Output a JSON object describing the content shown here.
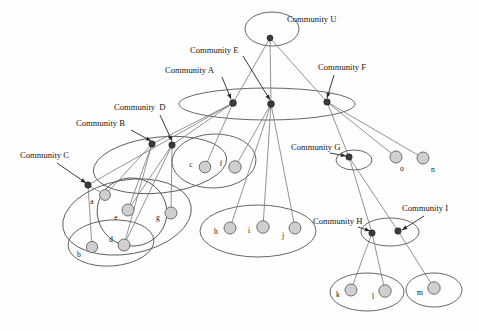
{
  "figure": {
    "colors": {
      "community_node": "#3b3b3b",
      "leaf_node": "#cfcfcf",
      "leaf_outline": "#6f6f6f",
      "ellipse_outline": "#555555",
      "edge": "#777777",
      "label_text": "#141414",
      "background": "#ffffff"
    }
  },
  "community_labels": [
    {
      "id": "U",
      "text": "Community U",
      "x": 287,
      "y": 22,
      "anchor": "start"
    },
    {
      "id": "E",
      "text": "Community E",
      "x": 190,
      "y": 53,
      "anchor": "start"
    },
    {
      "id": "A",
      "text": "Community A",
      "x": 165,
      "y": 73,
      "anchor": "start"
    },
    {
      "id": "F",
      "text": "Community F",
      "x": 318,
      "y": 70,
      "anchor": "start"
    },
    {
      "id": "D",
      "text": "Community  D",
      "x": 114,
      "y": 110,
      "anchor": "start"
    },
    {
      "id": "B",
      "text": "Community B",
      "x": 76,
      "y": 126,
      "anchor": "start"
    },
    {
      "id": "C",
      "text": "Community C",
      "x": 20,
      "y": 158,
      "anchor": "start"
    },
    {
      "id": "G",
      "text": "Community G",
      "x": 291,
      "y": 150,
      "anchor": "start"
    },
    {
      "id": "H",
      "text": "Community H",
      "x": 313,
      "y": 224,
      "anchor": "start"
    },
    {
      "id": "I",
      "text": "Community I",
      "x": 402,
      "y": 211,
      "anchor": "start"
    }
  ],
  "leader_lines": [
    {
      "name": "leader-E",
      "from": [
        243,
        56
      ],
      "to": [
        270,
        100
      ]
    },
    {
      "name": "leader-A",
      "from": [
        222,
        77
      ],
      "to": [
        231,
        99
      ]
    },
    {
      "name": "leader-F",
      "from": [
        334,
        75
      ],
      "to": [
        327,
        98
      ]
    },
    {
      "name": "leader-D",
      "from": [
        160,
        115
      ],
      "to": [
        172,
        141
      ]
    },
    {
      "name": "leader-B",
      "from": [
        131,
        130
      ],
      "to": [
        151,
        141
      ]
    },
    {
      "name": "leader-C",
      "from": [
        57,
        163
      ],
      "to": [
        86,
        183
      ]
    },
    {
      "name": "leader-G",
      "from": [
        330,
        153
      ],
      "to": [
        346,
        156
      ]
    },
    {
      "name": "leader-H",
      "from": [
        358,
        227
      ],
      "to": [
        370,
        231
      ]
    },
    {
      "name": "leader-I",
      "from": [
        424,
        216
      ],
      "to": [
        402,
        230
      ]
    }
  ],
  "community_nodes": [
    {
      "id": "U",
      "x": 270,
      "y": 38,
      "r": 3.0
    },
    {
      "id": "A",
      "x": 233,
      "y": 103,
      "r": 3.4
    },
    {
      "id": "E",
      "x": 271,
      "y": 104,
      "r": 3.4
    },
    {
      "id": "F",
      "x": 327,
      "y": 102,
      "r": 3.2
    },
    {
      "id": "B",
      "x": 152,
      "y": 144,
      "r": 3.2
    },
    {
      "id": "D",
      "x": 172,
      "y": 145,
      "r": 3.2
    },
    {
      "id": "C",
      "x": 88,
      "y": 185,
      "r": 3.2
    },
    {
      "id": "G",
      "x": 349,
      "y": 157,
      "r": 3.2
    },
    {
      "id": "H",
      "x": 372,
      "y": 233,
      "r": 3.2
    },
    {
      "id": "I",
      "x": 398,
      "y": 231,
      "r": 3.2
    }
  ],
  "leaf_nodes": [
    {
      "id": "a",
      "x": 105,
      "y": 195,
      "r": 5.4,
      "lx": 92,
      "ly": 204
    },
    {
      "id": "e",
      "x": 128,
      "y": 210,
      "r": 6.0,
      "lx": 116,
      "ly": 220
    },
    {
      "id": "g",
      "x": 171,
      "y": 213,
      "r": 6.0,
      "lx": 158,
      "ly": 220
    },
    {
      "id": "b",
      "x": 92,
      "y": 247,
      "r": 5.6,
      "lx": 79,
      "ly": 257
    },
    {
      "id": "d",
      "x": 124,
      "y": 245,
      "r": 6.0,
      "lx": 111,
      "ly": 242
    },
    {
      "id": "c",
      "x": 205,
      "y": 167,
      "r": 5.8,
      "lx": 191,
      "ly": 167
    },
    {
      "id": "f",
      "x": 235,
      "y": 167,
      "r": 6.2,
      "lx": 221,
      "ly": 166
    },
    {
      "id": "h",
      "x": 230,
      "y": 228,
      "r": 6.0,
      "lx": 216,
      "ly": 234
    },
    {
      "id": "i",
      "x": 263,
      "y": 227,
      "r": 6.2,
      "lx": 249,
      "ly": 233
    },
    {
      "id": "j",
      "x": 295,
      "y": 228,
      "r": 6.0,
      "lx": 283,
      "ly": 238
    },
    {
      "id": "o",
      "x": 396,
      "y": 157,
      "r": 6.0,
      "lx": 402,
      "ly": 171
    },
    {
      "id": "n",
      "x": 423,
      "y": 158,
      "r": 6.0,
      "lx": 433,
      "ly": 172
    },
    {
      "id": "k",
      "x": 351,
      "y": 290,
      "r": 6.0,
      "lx": 338,
      "ly": 297
    },
    {
      "id": "l",
      "x": 385,
      "y": 291,
      "r": 6.2,
      "lx": 373,
      "ly": 299
    },
    {
      "id": "m",
      "x": 434,
      "y": 288,
      "r": 6.2,
      "lx": 420,
      "ly": 295
    }
  ],
  "ellipses": [
    {
      "name": "ellipse-community-u",
      "cx": 272,
      "cy": 29,
      "rx": 27,
      "ry": 17,
      "rot": 0
    },
    {
      "name": "ellipse-top-level",
      "cx": 267,
      "cy": 104,
      "rx": 88,
      "ry": 16,
      "rot": 0
    },
    {
      "name": "ellipse-left-upper",
      "cx": 160,
      "cy": 165,
      "rx": 67,
      "ry": 28,
      "rot": -6
    },
    {
      "name": "ellipse-left-lower",
      "cx": 127,
      "cy": 217,
      "rx": 65,
      "ry": 37,
      "rot": -10
    },
    {
      "name": "ellipse-bd-inner",
      "cx": 111,
      "cy": 243,
      "rx": 43,
      "ry": 23,
      "rot": -4
    },
    {
      "name": "ellipse-ae-inner",
      "cx": 132,
      "cy": 212,
      "rx": 35,
      "ry": 34,
      "rot": 18
    },
    {
      "name": "ellipse-c-f",
      "cx": 214,
      "cy": 161,
      "rx": 42,
      "ry": 27,
      "rot": -2
    },
    {
      "name": "ellipse-h-i-j",
      "cx": 258,
      "cy": 231,
      "rx": 58,
      "ry": 26,
      "rot": 0
    },
    {
      "name": "ellipse-community-g",
      "cx": 354,
      "cy": 160,
      "rx": 18,
      "ry": 10,
      "rot": 0
    },
    {
      "name": "ellipse-community-h-i",
      "cx": 390,
      "cy": 232,
      "rx": 29,
      "ry": 14,
      "rot": 0
    },
    {
      "name": "ellipse-k-l",
      "cx": 367,
      "cy": 292,
      "rx": 37,
      "ry": 19,
      "rot": 0
    },
    {
      "name": "ellipse-m",
      "cx": 434,
      "cy": 290,
      "rx": 28,
      "ry": 17,
      "rot": 0
    }
  ],
  "edges": [
    {
      "from": "U",
      "to": "A"
    },
    {
      "from": "U",
      "to": "E"
    },
    {
      "from": "U",
      "to": "F"
    },
    {
      "from": "A",
      "to": "B"
    },
    {
      "from": "A",
      "to": "D"
    },
    {
      "from": "A",
      "to": "C"
    },
    {
      "from": "A",
      "to": "c"
    },
    {
      "from": "E",
      "to": "f"
    },
    {
      "from": "E",
      "to": "h"
    },
    {
      "from": "E",
      "to": "i"
    },
    {
      "from": "E",
      "to": "j"
    },
    {
      "from": "F",
      "to": "G"
    },
    {
      "from": "F",
      "to": "o"
    },
    {
      "from": "F",
      "to": "n"
    },
    {
      "from": "B",
      "to": "a"
    },
    {
      "from": "B",
      "to": "e"
    },
    {
      "from": "B",
      "to": "d"
    },
    {
      "from": "D",
      "to": "e"
    },
    {
      "from": "D",
      "to": "g"
    },
    {
      "from": "D",
      "to": "d"
    },
    {
      "from": "C",
      "to": "a"
    },
    {
      "from": "C",
      "to": "b"
    },
    {
      "from": "G",
      "to": "H"
    },
    {
      "from": "G",
      "to": "I"
    },
    {
      "from": "H",
      "to": "k"
    },
    {
      "from": "H",
      "to": "l"
    },
    {
      "from": "I",
      "to": "m"
    }
  ]
}
